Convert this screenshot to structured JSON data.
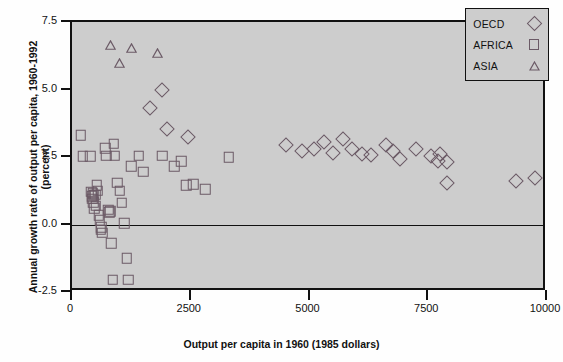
{
  "chart_data": {
    "type": "scatter",
    "title": "",
    "xlabel": "Output per capita in 1960 (1985 dollars)",
    "ylabel": "Annual growth rate of output per capita, 1960-1992 (percent)",
    "xlim": [
      0,
      10000
    ],
    "ylim": [
      -2.5,
      7.5
    ],
    "xticks": [
      0,
      2500,
      5000,
      7500,
      10000
    ],
    "xtick_labels": [
      "0",
      "2500",
      "5000",
      "7500",
      "10000"
    ],
    "yticks": [
      -2.5,
      0.0,
      2.5,
      5.0,
      7.5
    ],
    "ytick_labels": [
      "-2.5",
      "0.0",
      "2.5",
      "5.0",
      "7.5"
    ],
    "grid": false,
    "zero_line": 0.0,
    "legend_position": "top-right",
    "plot_background": "#cdcdcd",
    "marker_color": "#6b5a66",
    "axis_color": "#111111",
    "series": [
      {
        "name": "OECD",
        "marker": "diamond",
        "points": [
          [
            1650,
            4.3
          ],
          [
            1900,
            5.0
          ],
          [
            2000,
            3.55
          ],
          [
            2450,
            3.25
          ],
          [
            4500,
            2.95
          ],
          [
            4850,
            2.72
          ],
          [
            5100,
            2.78
          ],
          [
            5300,
            3.05
          ],
          [
            5500,
            2.65
          ],
          [
            5700,
            3.15
          ],
          [
            5900,
            2.8
          ],
          [
            6100,
            2.6
          ],
          [
            6300,
            2.58
          ],
          [
            6600,
            2.95
          ],
          [
            6750,
            2.72
          ],
          [
            6900,
            2.42
          ],
          [
            7250,
            2.78
          ],
          [
            7550,
            2.55
          ],
          [
            7700,
            2.35
          ],
          [
            7750,
            2.62
          ],
          [
            7900,
            2.3
          ],
          [
            7900,
            1.55
          ],
          [
            9350,
            1.6
          ],
          [
            9750,
            1.72
          ]
        ]
      },
      {
        "name": "AFRICA",
        "marker": "square",
        "points": [
          [
            180,
            3.3
          ],
          [
            230,
            2.52
          ],
          [
            380,
            2.52
          ],
          [
            400,
            1.22
          ],
          [
            420,
            1.05
          ],
          [
            430,
            0.95
          ],
          [
            440,
            1.15
          ],
          [
            450,
            0.82
          ],
          [
            460,
            1.08
          ],
          [
            470,
            0.6
          ],
          [
            490,
            1.1
          ],
          [
            500,
            0.7
          ],
          [
            520,
            1.45
          ],
          [
            540,
            1.25
          ],
          [
            560,
            0.35
          ],
          [
            580,
            0.15
          ],
          [
            600,
            -0.2
          ],
          [
            620,
            -0.1
          ],
          [
            640,
            -0.3
          ],
          [
            700,
            2.82
          ],
          [
            720,
            2.55
          ],
          [
            760,
            0.55
          ],
          [
            780,
            0.45
          ],
          [
            800,
            0.5
          ],
          [
            830,
            -0.7
          ],
          [
            860,
            -2.05
          ],
          [
            880,
            3.0
          ],
          [
            900,
            2.55
          ],
          [
            950,
            1.55
          ],
          [
            1000,
            1.25
          ],
          [
            1050,
            0.8
          ],
          [
            1100,
            0.05
          ],
          [
            1150,
            -1.25
          ],
          [
            1180,
            -2.05
          ],
          [
            1250,
            2.15
          ],
          [
            1400,
            2.55
          ],
          [
            1500,
            1.95
          ],
          [
            1900,
            2.55
          ],
          [
            2150,
            2.15
          ],
          [
            2300,
            2.35
          ],
          [
            2400,
            1.45
          ],
          [
            2550,
            1.5
          ],
          [
            2800,
            1.3
          ],
          [
            3300,
            2.5
          ]
        ]
      },
      {
        "name": "ASIA",
        "marker": "triangle",
        "points": [
          [
            820,
            6.45
          ],
          [
            1000,
            5.8
          ],
          [
            1250,
            6.35
          ],
          [
            1800,
            6.15
          ]
        ]
      }
    ]
  },
  "legend": {
    "items": [
      {
        "label": "OECD",
        "marker": "diamond-icon"
      },
      {
        "label": "AFRICA",
        "marker": "square-icon"
      },
      {
        "label": "ASIA",
        "marker": "triangle-icon"
      }
    ]
  }
}
